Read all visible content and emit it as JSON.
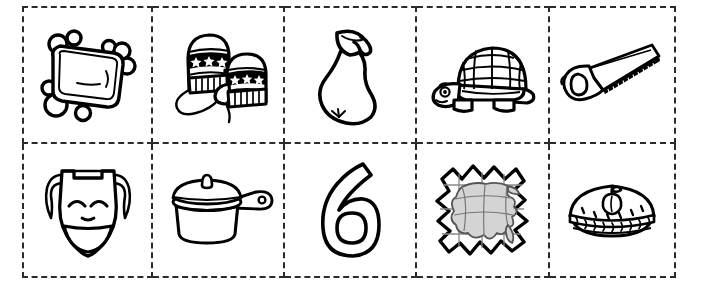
{
  "sheet": {
    "title": "Picture Card Cut-Out Worksheet",
    "background_color": "#ffffff",
    "ink_color": "#000000",
    "cut_line_color": "#2b2b2b",
    "shade_color": "#d4d4d4",
    "rows": 2,
    "columns": 5,
    "style": "black and white line art clip art, dashed cutting guides"
  },
  "cards": [
    {
      "position": "row1-col1",
      "icon_name": "soap-bar-with-bubbles-icon",
      "label": "soap",
      "description": "Bar of soap surrounded by round bubbles"
    },
    {
      "position": "row1-col2",
      "icon_name": "mittens-icon",
      "label": "mittens",
      "description": "Pair of striped mittens with star bands, ribbed cuffs and connecting cord"
    },
    {
      "position": "row1-col3",
      "icon_name": "pear-icon",
      "label": "pear",
      "description": "Pear with stem and single leaf"
    },
    {
      "position": "row1-col4",
      "icon_name": "turtle-icon",
      "label": "turtle",
      "description": "Smiling turtle with grid patterned domed shell"
    },
    {
      "position": "row1-col5",
      "icon_name": "handsaw-icon",
      "label": "saw",
      "description": "Handsaw with serrated blade and closed grip handle"
    },
    {
      "position": "row2-col1",
      "icon_name": "smiling-mask-icon",
      "label": "mask",
      "description": "Theatrical smiling mask with curled side tufts"
    },
    {
      "position": "row2-col2",
      "icon_name": "saucepan-icon",
      "label": "pan",
      "description": "Saucepan with domed lid, knob and side handle with hanging hole"
    },
    {
      "position": "row2-col3",
      "icon_name": "numeral-six-icon",
      "label": "6",
      "description": "Outlined numeral six"
    },
    {
      "position": "row2-col4",
      "icon_name": "jigsaw-puzzle-map-icon",
      "label": "puzzle",
      "description": "Jigsaw puzzle forming a grey shaded map shape"
    },
    {
      "position": "row2-col5",
      "icon_name": "apple-pie-icon",
      "label": "pie",
      "description": "Apple pie with braided crust edge, vent slits and apple decoration"
    }
  ]
}
